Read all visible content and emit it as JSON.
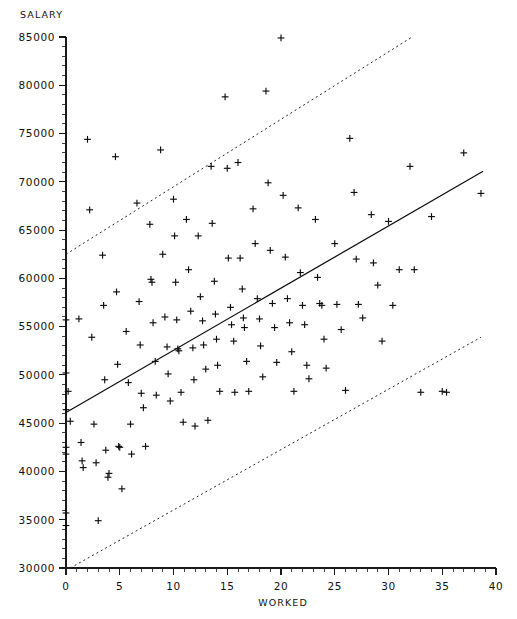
{
  "chart_data": {
    "type": "scatter",
    "title": "",
    "xlabel": "WORKED",
    "ylabel": "SALARY",
    "xlim": [
      0,
      40
    ],
    "ylim": [
      30000,
      85000
    ],
    "xticks": [
      0,
      5,
      10,
      15,
      20,
      25,
      30,
      35,
      40
    ],
    "xtick_labels": [
      "0",
      "5",
      "10",
      "15",
      "20",
      "25",
      "30",
      "35",
      "40"
    ],
    "yticks": [
      30000,
      35000,
      40000,
      45000,
      50000,
      55000,
      60000,
      65000,
      70000,
      75000,
      80000,
      85000
    ],
    "ytick_labels": [
      "30000",
      "35000",
      "40000",
      "45000",
      "50000",
      "55000",
      "60000",
      "65000",
      "70000",
      "75000",
      "80000",
      "85000"
    ],
    "grid": false,
    "legend": null,
    "minor_ticks_per_interval": 5,
    "marker": "plus",
    "marker_color": "#0d0d0d",
    "points": [
      [
        0.0,
        55700
      ],
      [
        0.0,
        50200
      ],
      [
        0.0,
        46400
      ],
      [
        0.0,
        42500
      ],
      [
        0.0,
        41800
      ],
      [
        0.0,
        35700
      ],
      [
        0.0,
        34400
      ],
      [
        0.2,
        48300
      ],
      [
        0.4,
        45200
      ],
      [
        1.2,
        55800
      ],
      [
        1.4,
        43000
      ],
      [
        1.5,
        41100
      ],
      [
        1.6,
        40400
      ],
      [
        2.0,
        74400
      ],
      [
        2.2,
        67100
      ],
      [
        2.4,
        53900
      ],
      [
        2.6,
        44900
      ],
      [
        2.8,
        40900
      ],
      [
        3.0,
        34900
      ],
      [
        3.4,
        62400
      ],
      [
        3.5,
        57200
      ],
      [
        3.6,
        49500
      ],
      [
        3.7,
        42200
      ],
      [
        3.9,
        39400
      ],
      [
        4.0,
        39800
      ],
      [
        4.6,
        72600
      ],
      [
        4.7,
        58600
      ],
      [
        4.8,
        51100
      ],
      [
        4.9,
        42600
      ],
      [
        5.0,
        42500
      ],
      [
        5.2,
        38200
      ],
      [
        5.6,
        54500
      ],
      [
        5.8,
        49200
      ],
      [
        6.0,
        44900
      ],
      [
        6.1,
        41800
      ],
      [
        6.6,
        67800
      ],
      [
        6.8,
        57600
      ],
      [
        6.9,
        53100
      ],
      [
        7.0,
        48100
      ],
      [
        7.2,
        46600
      ],
      [
        7.4,
        42600
      ],
      [
        7.8,
        65600
      ],
      [
        7.9,
        59900
      ],
      [
        8.0,
        59600
      ],
      [
        8.1,
        55400
      ],
      [
        8.3,
        51400
      ],
      [
        8.4,
        47900
      ],
      [
        8.8,
        73300
      ],
      [
        9.0,
        62500
      ],
      [
        9.2,
        56000
      ],
      [
        9.4,
        52900
      ],
      [
        9.5,
        50100
      ],
      [
        9.7,
        47300
      ],
      [
        10.0,
        68200
      ],
      [
        10.1,
        64400
      ],
      [
        10.2,
        59600
      ],
      [
        10.3,
        55700
      ],
      [
        10.4,
        52700
      ],
      [
        10.5,
        52500
      ],
      [
        10.7,
        48200
      ],
      [
        10.9,
        45100
      ],
      [
        11.2,
        66100
      ],
      [
        11.4,
        60900
      ],
      [
        11.6,
        56600
      ],
      [
        11.8,
        52800
      ],
      [
        11.9,
        49500
      ],
      [
        12.0,
        44700
      ],
      [
        12.3,
        64400
      ],
      [
        12.5,
        58100
      ],
      [
        12.7,
        55600
      ],
      [
        12.8,
        53100
      ],
      [
        13.0,
        50600
      ],
      [
        13.2,
        45300
      ],
      [
        13.5,
        71600
      ],
      [
        13.6,
        65700
      ],
      [
        13.8,
        59700
      ],
      [
        13.9,
        56300
      ],
      [
        14.0,
        53700
      ],
      [
        14.1,
        51000
      ],
      [
        14.3,
        48300
      ],
      [
        14.8,
        78800
      ],
      [
        15.0,
        71400
      ],
      [
        15.1,
        62100
      ],
      [
        15.3,
        57000
      ],
      [
        15.4,
        55200
      ],
      [
        15.6,
        53500
      ],
      [
        15.7,
        48200
      ],
      [
        16.0,
        72000
      ],
      [
        16.2,
        62100
      ],
      [
        16.4,
        58900
      ],
      [
        16.5,
        55900
      ],
      [
        16.6,
        54900
      ],
      [
        16.8,
        51400
      ],
      [
        17.0,
        48300
      ],
      [
        17.4,
        67200
      ],
      [
        17.6,
        63600
      ],
      [
        17.8,
        57900
      ],
      [
        18.0,
        55800
      ],
      [
        18.1,
        53000
      ],
      [
        18.3,
        49800
      ],
      [
        18.6,
        79400
      ],
      [
        18.8,
        69900
      ],
      [
        19.0,
        62900
      ],
      [
        19.2,
        57400
      ],
      [
        19.4,
        54900
      ],
      [
        19.6,
        51300
      ],
      [
        20.0,
        84900
      ],
      [
        20.2,
        68600
      ],
      [
        20.4,
        62200
      ],
      [
        20.6,
        57900
      ],
      [
        20.8,
        55400
      ],
      [
        21.0,
        52400
      ],
      [
        21.2,
        48300
      ],
      [
        21.6,
        67300
      ],
      [
        21.8,
        60600
      ],
      [
        22.0,
        57200
      ],
      [
        22.2,
        55200
      ],
      [
        22.4,
        51000
      ],
      [
        22.6,
        49600
      ],
      [
        23.2,
        66100
      ],
      [
        23.4,
        60100
      ],
      [
        23.6,
        57400
      ],
      [
        23.8,
        57200
      ],
      [
        24.0,
        53700
      ],
      [
        24.2,
        50700
      ],
      [
        25.0,
        63600
      ],
      [
        25.2,
        57300
      ],
      [
        25.6,
        54700
      ],
      [
        26.0,
        48400
      ],
      [
        26.4,
        74500
      ],
      [
        26.8,
        68900
      ],
      [
        27.0,
        62000
      ],
      [
        27.2,
        57300
      ],
      [
        27.6,
        55900
      ],
      [
        28.4,
        66600
      ],
      [
        28.6,
        61600
      ],
      [
        29.0,
        59300
      ],
      [
        29.4,
        53500
      ],
      [
        30.0,
        65900
      ],
      [
        30.4,
        57200
      ],
      [
        31.0,
        60900
      ],
      [
        32.0,
        71600
      ],
      [
        32.4,
        60900
      ],
      [
        33.0,
        48200
      ],
      [
        34.0,
        66400
      ],
      [
        35.0,
        48300
      ],
      [
        35.4,
        48200
      ],
      [
        37.0,
        73000
      ],
      [
        38.6,
        68800
      ]
    ],
    "fit_line": {
      "label": "regression-line",
      "style": "solid",
      "points": [
        [
          0,
          46100
        ],
        [
          38.8,
          71100
        ]
      ]
    },
    "bands": [
      {
        "label": "upper-band",
        "style": "dashed",
        "points": [
          [
            0,
            62500
          ],
          [
            32.2,
            85000
          ]
        ]
      },
      {
        "label": "lower-band",
        "style": "dashed",
        "points": [
          [
            0.4,
            30000
          ],
          [
            38.6,
            53900
          ]
        ]
      }
    ]
  }
}
